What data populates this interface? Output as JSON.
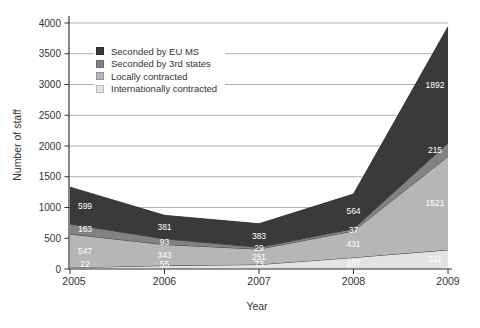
{
  "chart_data": {
    "type": "area",
    "stacked": true,
    "title": "",
    "xlabel": "Year",
    "ylabel": "Number of staff",
    "x": [
      2005,
      2006,
      2007,
      2008,
      2009
    ],
    "ylim": [
      0,
      4000
    ],
    "ytick_step": 500,
    "grid": true,
    "legend_position": "top-left-inside",
    "series": [
      {
        "name": "Seconded by EU MS",
        "color": "#3a3a3a",
        "values": [
          599,
          381,
          383,
          564,
          1892
        ]
      },
      {
        "name": "Seconded by 3rd states",
        "color": "#828282",
        "values": [
          163,
          93,
          29,
          37,
          215
        ]
      },
      {
        "name": "Locally contracted",
        "color": "#b6b6b6",
        "values": [
          547,
          343,
          251,
          431,
          1521
        ]
      },
      {
        "name": "Internationally contracted",
        "color": "#e3e3e3",
        "values": [
          22,
          55,
          73,
          187,
          311
        ]
      }
    ],
    "label_color": "#ffffff",
    "axis_color": "#333333",
    "grid_color": "#9b9b9b"
  }
}
